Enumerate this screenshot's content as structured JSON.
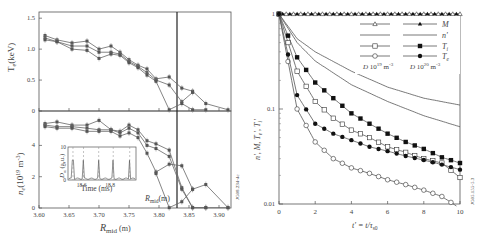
{
  "chart_data": [
    {
      "type": "line",
      "panel": "left-top",
      "title": "",
      "xlabel": "R_mid (m)",
      "ylabel": "T_e (keV)",
      "xlim": [
        3.6,
        3.92
      ],
      "ylim": [
        0,
        1.6
      ],
      "xticks": [
        "3.60",
        "3.65",
        "3.70",
        "3.75",
        "3.80",
        "3.85",
        "3.90"
      ],
      "yticks": [
        "0",
        "0.5",
        "1.0",
        "1.5"
      ],
      "vline_x": 3.837,
      "series": [
        {
          "name": "profile-1",
          "x": [
            3.61,
            3.63,
            3.655,
            3.68,
            3.7,
            3.72,
            3.735,
            3.75,
            3.765,
            3.78,
            3.795,
            3.817,
            3.838,
            3.856,
            3.878,
            3.915
          ],
          "y": [
            1.22,
            1.15,
            1.1,
            1.13,
            1.0,
            1.05,
            0.95,
            0.83,
            0.74,
            0.68,
            0.52,
            0.55,
            0.37,
            0.32,
            0.12,
            0.02
          ]
        },
        {
          "name": "profile-2",
          "x": [
            3.61,
            3.63,
            3.655,
            3.68,
            3.7,
            3.72,
            3.735,
            3.75,
            3.765,
            3.78,
            3.795,
            3.817,
            3.838,
            3.856
          ],
          "y": [
            1.18,
            1.12,
            1.05,
            1.05,
            0.95,
            0.95,
            0.92,
            0.8,
            0.72,
            0.62,
            0.5,
            0.42,
            0.15,
            0.3
          ]
        },
        {
          "name": "profile-3",
          "x": [
            3.61,
            3.63,
            3.655,
            3.68,
            3.7,
            3.72,
            3.735,
            3.75,
            3.765,
            3.78,
            3.795,
            3.817,
            3.838,
            3.856,
            3.878
          ],
          "y": [
            1.15,
            1.12,
            1.0,
            0.98,
            0.85,
            0.92,
            0.9,
            0.78,
            0.7,
            0.58,
            0.48,
            0.02,
            0.12,
            0.02,
            0.02
          ]
        }
      ]
    },
    {
      "type": "line",
      "panel": "left-bottom",
      "xlabel": "R_mid (m)",
      "ylabel": "n_e (10^19 m^-3)",
      "xlim": [
        3.6,
        3.92
      ],
      "ylim": [
        0,
        6.2
      ],
      "yticks": [
        "0",
        "2",
        "4"
      ],
      "vline_x": 3.837,
      "series": [
        {
          "name": "profile-1",
          "x": [
            3.61,
            3.63,
            3.655,
            3.68,
            3.7,
            3.72,
            3.735,
            3.75,
            3.765,
            3.78,
            3.795,
            3.817,
            3.838,
            3.856,
            3.878,
            3.915
          ],
          "y": [
            5.4,
            5.5,
            5.3,
            5.3,
            5.6,
            5.0,
            4.9,
            5.3,
            5.0,
            4.3,
            4.1,
            3.7,
            1.3,
            0.02,
            0.02,
            0.02
          ]
        },
        {
          "name": "profile-2",
          "x": [
            3.61,
            3.63,
            3.655,
            3.68,
            3.7,
            3.72,
            3.735,
            3.75,
            3.765,
            3.78,
            3.795,
            3.817,
            3.838,
            3.856,
            3.878
          ],
          "y": [
            5.3,
            5.2,
            5.2,
            5.1,
            5.0,
            5.0,
            4.8,
            5.1,
            4.8,
            4.0,
            3.8,
            3.3,
            1.2,
            0.02,
            0.02
          ]
        },
        {
          "name": "profile-3",
          "x": [
            3.61,
            3.63,
            3.655,
            3.68,
            3.7,
            3.72,
            3.735,
            3.75,
            3.765,
            3.78,
            3.795,
            3.817,
            3.838,
            3.856,
            3.878,
            3.915
          ],
          "y": [
            5.2,
            5.1,
            5.1,
            4.9,
            4.9,
            4.9,
            4.6,
            4.8,
            4.5,
            3.5,
            2.3,
            2.8,
            2.7,
            1.2,
            1.5,
            0.02
          ]
        },
        {
          "name": "profile-4",
          "x": [
            3.795,
            3.817,
            3.838,
            3.856
          ],
          "y": [
            2.2,
            0.02,
            0.4,
            1.2
          ]
        }
      ],
      "inset": {
        "xlabel": "Time (ms)",
        "ylabel": "D_α (a.u.)",
        "xticks": [
          "18.6",
          "18.8"
        ],
        "yticks": [
          "0",
          "5",
          "10"
        ],
        "label_annotation": "R_mid (m)"
      },
      "side_label": "JG08.234-4c"
    },
    {
      "type": "line",
      "panel": "right",
      "xlabel": "t' = t/τ_s0",
      "ylabel": "n', M, T_e', T_i'",
      "xlim": [
        0,
        10
      ],
      "ylim": [
        0.01,
        1
      ],
      "yscale": "log",
      "xticks": [
        "0",
        "2",
        "4",
        "6",
        "8",
        "10"
      ],
      "yticks": [
        "0.01",
        "0.1",
        "1"
      ],
      "legend": {
        "columns": [
          "D 10^19 m^-3",
          "D 10^20 m^-3"
        ],
        "rows": [
          "M",
          "n'",
          "T_i'",
          "T_e'"
        ]
      },
      "series": [
        {
          "name": "M (10^19, open triangle)",
          "x": [
            0,
            2,
            4,
            6,
            8,
            10
          ],
          "y": [
            1,
            1,
            1,
            1,
            1,
            1
          ]
        },
        {
          "name": "M (10^20, filled triangle)",
          "x": [
            0,
            2,
            4,
            6,
            8,
            10
          ],
          "y": [
            1,
            1,
            1,
            1,
            1,
            1
          ]
        },
        {
          "name": "n' (10^19)",
          "x": [
            0,
            1,
            2,
            4,
            6,
            8,
            10
          ],
          "y": [
            1,
            0.55,
            0.4,
            0.25,
            0.17,
            0.13,
            0.11
          ]
        },
        {
          "name": "n' (10^20)",
          "x": [
            0,
            1,
            2,
            4,
            6,
            8,
            10
          ],
          "y": [
            1,
            0.5,
            0.32,
            0.18,
            0.12,
            0.085,
            0.065
          ]
        },
        {
          "name": "T_i' (10^19, open square)",
          "x": [
            0,
            1,
            2,
            3,
            4,
            5,
            6,
            7,
            8,
            9,
            10
          ],
          "y": [
            1,
            0.25,
            0.12,
            0.08,
            0.06,
            0.05,
            0.04,
            0.035,
            0.03,
            0.027,
            0.019
          ]
        },
        {
          "name": "T_i' (10^20, filled square)",
          "x": [
            0,
            1,
            2,
            3,
            4,
            5,
            6,
            7,
            8,
            9,
            10
          ],
          "y": [
            1,
            0.35,
            0.19,
            0.13,
            0.09,
            0.07,
            0.055,
            0.045,
            0.038,
            0.031,
            0.027
          ]
        },
        {
          "name": "T_e' (10^19, open circle)",
          "x": [
            0,
            1,
            2,
            3,
            4,
            5,
            6,
            7,
            8,
            9,
            10
          ],
          "y": [
            1,
            0.1,
            0.045,
            0.03,
            0.024,
            0.021,
            0.018,
            0.016,
            0.014,
            0.012,
            0.009
          ]
        },
        {
          "name": "T_e' (10^20, filled circle)",
          "x": [
            0,
            1,
            2,
            3,
            4,
            5,
            6,
            7,
            8,
            9,
            10
          ],
          "y": [
            1,
            0.14,
            0.07,
            0.055,
            0.047,
            0.04,
            0.036,
            0.032,
            0.029,
            0.026,
            0.023
          ]
        }
      ],
      "side_label": "JG05.155-5.3"
    }
  ],
  "labels": {
    "left_xlabel_main": "R",
    "left_xlabel_sub": "mid",
    "left_xlabel_unit": " (m)",
    "te_ylabel": "T",
    "te_ylabel_sub": "e",
    "te_ylabel_unit": "(keV)",
    "ne_ylabel": "n",
    "ne_ylabel_sub": "e",
    "ne_ylabel_unit": "(10",
    "ne_ylabel_exp": "19",
    "ne_ylabel_unit2": " m",
    "ne_ylabel_exp2": "-3",
    "ne_ylabel_close": ")",
    "inset_xlabel": "Time (ms)",
    "inset_ylabel": "D",
    "inset_ylabel_sub": "α",
    "inset_ylabel_unit": " (a.u.)",
    "rmid_annot": "R",
    "rmid_annot_sub": "mid",
    "rmid_annot_unit": "(m)",
    "left_side_id": "JG08.234-4c",
    "right_side_id": "JG05.155-5.3",
    "right_xlabel": "t' = t/τ",
    "right_xlabel_sub": "s0",
    "right_ylabel": "n', M, T",
    "right_ylabel_sub1": "e",
    "right_ylabel_mid": "', T",
    "right_ylabel_sub2": "i",
    "right_ylabel_end": "'",
    "legend_M": "M",
    "legend_n": "n'",
    "legend_Ti": "T",
    "legend_Ti_sub": "i",
    "legend_Te": "T",
    "legend_Te_sub": "e",
    "legend_col1": "D 10",
    "legend_col1_exp": "19",
    "legend_col1_unit": " m",
    "legend_col1_exp2": "-3",
    "legend_col2": "D 10",
    "legend_col2_exp": "20",
    "legend_col2_unit": " m",
    "legend_col2_exp2": "-3",
    "te_ticks": [
      "0",
      "0.5",
      "1.0",
      "1.5"
    ],
    "ne_ticks": [
      "0",
      "2",
      "4"
    ],
    "r_ticks": [
      "3.60",
      "3.65",
      "3.70",
      "3.75",
      "3.80",
      "3.85",
      "3.90"
    ],
    "inset_xticks": [
      "18.6",
      "18.8"
    ],
    "inset_yticks": [
      "0",
      "5",
      "10"
    ],
    "right_xticks": [
      "0",
      "2",
      "4",
      "6",
      "8",
      "10"
    ],
    "right_yticks": [
      "0.01",
      "0.1",
      "1"
    ]
  }
}
